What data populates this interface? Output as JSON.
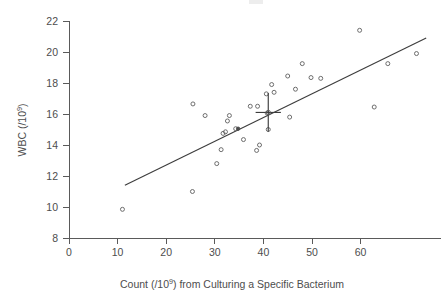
{
  "figure": {
    "background_color": "#ffffff",
    "ink_color": "#4d4d4d"
  },
  "chart_data": {
    "type": "scatter",
    "title": "",
    "subtitle": "",
    "xlabel": "Count (/10⁹) from Culturing a Specific Bacterium",
    "xlabel_parts": {
      "before": "Count (/10",
      "exponent": "9",
      "after": ") from Culturing a Specific Bacterium"
    },
    "ylabel": "WBC (/10⁹)",
    "ylabel_parts": {
      "before": "WBC (/10",
      "exponent": "9",
      "after": ")"
    },
    "xlim": [
      0,
      73.5
    ],
    "ylim": [
      7.3,
      22.6
    ],
    "xticks": [
      0,
      10,
      20,
      30,
      40,
      50,
      60
    ],
    "yticks": [
      8,
      10,
      12,
      14,
      16,
      18,
      20,
      22
    ],
    "xtick_labels": [
      "0",
      "10",
      "20",
      "30",
      "40",
      "50",
      "60"
    ],
    "ytick_labels": [
      "8",
      "10",
      "12",
      "14",
      "16",
      "18",
      "20",
      "22"
    ],
    "grid": false,
    "legend": null,
    "legend_position": "none",
    "marker": "open-circle",
    "marker_color": "#5f5f5f",
    "line_color": "#3d3d3d",
    "points": [
      {
        "x": 11.0,
        "y": 9.85
      },
      {
        "x": 25.4,
        "y": 11.0
      },
      {
        "x": 25.5,
        "y": 16.65
      },
      {
        "x": 28.0,
        "y": 15.9
      },
      {
        "x": 30.4,
        "y": 12.8
      },
      {
        "x": 31.3,
        "y": 13.7
      },
      {
        "x": 31.7,
        "y": 14.75
      },
      {
        "x": 32.2,
        "y": 14.85
      },
      {
        "x": 32.6,
        "y": 15.55
      },
      {
        "x": 33.0,
        "y": 15.9
      },
      {
        "x": 34.3,
        "y": 15.05
      },
      {
        "x": 34.8,
        "y": 15.05,
        "filled": true
      },
      {
        "x": 35.9,
        "y": 14.35
      },
      {
        "x": 37.3,
        "y": 16.5
      },
      {
        "x": 38.6,
        "y": 13.65
      },
      {
        "x": 38.8,
        "y": 16.5
      },
      {
        "x": 39.2,
        "y": 14.0
      },
      {
        "x": 40.6,
        "y": 17.3
      },
      {
        "x": 40.8,
        "y": 16.05
      },
      {
        "x": 41.0,
        "y": 15.0
      },
      {
        "x": 41.7,
        "y": 17.9
      },
      {
        "x": 42.2,
        "y": 17.4
      },
      {
        "x": 45.0,
        "y": 18.45
      },
      {
        "x": 45.4,
        "y": 15.8
      },
      {
        "x": 46.6,
        "y": 17.6
      },
      {
        "x": 48.0,
        "y": 19.25
      },
      {
        "x": 49.8,
        "y": 18.35
      },
      {
        "x": 51.8,
        "y": 18.3
      },
      {
        "x": 59.8,
        "y": 21.4
      },
      {
        "x": 62.8,
        "y": 16.45
      },
      {
        "x": 65.6,
        "y": 19.25
      },
      {
        "x": 71.5,
        "y": 19.9
      }
    ],
    "fit_line": {
      "name": "regression-line",
      "x_start": 11.5,
      "y_start": 11.4,
      "x_end": 73.5,
      "y_end": 20.9
    },
    "centroid_marker": {
      "name": "centroid-cross",
      "x": 41.0,
      "y": 16.1,
      "x_error": 2.6,
      "y_error": 1.25
    }
  }
}
